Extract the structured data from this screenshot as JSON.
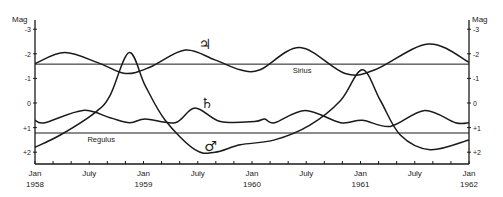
{
  "chart_data": {
    "type": "line",
    "title": "",
    "xlabel": "",
    "ylabel": "Mag",
    "ylabel_right": "Mag",
    "ylim": [
      2.4,
      -3.2
    ],
    "y_inverted": true,
    "y_ticks": [
      -3,
      -2,
      -1,
      0,
      1,
      2
    ],
    "y_tick_labels": [
      "-3",
      "-2",
      "-1",
      "0",
      "+1",
      "+2"
    ],
    "x_range_months": [
      0,
      48
    ],
    "x_tick_labels": [
      {
        "month": 0,
        "line1": "Jan",
        "line2": "1958"
      },
      {
        "month": 6,
        "line1": "July",
        "line2": ""
      },
      {
        "month": 12,
        "line1": "Jan",
        "line2": "1959"
      },
      {
        "month": 18,
        "line1": "July",
        "line2": ""
      },
      {
        "month": 24,
        "line1": "Jan",
        "line2": "1960"
      },
      {
        "month": 30,
        "line1": "July",
        "line2": ""
      },
      {
        "month": 36,
        "line1": "Jan",
        "line2": "1961"
      },
      {
        "month": 42,
        "line1": "July",
        "line2": ""
      },
      {
        "month": 48,
        "line1": "Jan",
        "line2": "1962"
      }
    ],
    "minor_tick_every_months": 2,
    "grid": false,
    "reference_lines": [
      {
        "name": "Sirius",
        "mag": -1.58,
        "label_month": 28.5
      },
      {
        "name": "Regulus",
        "mag": 1.22,
        "label_month": 5.8
      }
    ],
    "series": [
      {
        "name": "Jupiter",
        "symbol": "♃",
        "symbol_pos": {
          "month": 18.8,
          "mag": -2.4
        },
        "points": [
          [
            0,
            -1.6
          ],
          [
            3.3,
            -2.05
          ],
          [
            7.2,
            -1.6
          ],
          [
            10,
            -1.2
          ],
          [
            12.7,
            -1.45
          ],
          [
            16.6,
            -2.15
          ],
          [
            19.9,
            -1.75
          ],
          [
            22.7,
            -1.35
          ],
          [
            24.9,
            -1.35
          ],
          [
            29.3,
            -2.25
          ],
          [
            34.3,
            -1.2
          ],
          [
            37.6,
            -1.35
          ],
          [
            43.5,
            -2.4
          ],
          [
            48,
            -1.65
          ]
        ]
      },
      {
        "name": "Saturn",
        "symbol": "♄",
        "symbol_pos": {
          "month": 19.0,
          "mag": 0.0
        },
        "points": [
          [
            0,
            0.7
          ],
          [
            1.1,
            0.8
          ],
          [
            5.3,
            0.3
          ],
          [
            8.3,
            0.6
          ],
          [
            10.5,
            0.8
          ],
          [
            12.2,
            0.65
          ],
          [
            15.5,
            0.8
          ],
          [
            17.7,
            0.2
          ],
          [
            20.5,
            0.75
          ],
          [
            24.3,
            0.75
          ],
          [
            25.4,
            0.65
          ],
          [
            26.5,
            0.8
          ],
          [
            29.9,
            0.3
          ],
          [
            33.8,
            0.8
          ],
          [
            36.2,
            0.7
          ],
          [
            39.3,
            0.95
          ],
          [
            43.1,
            0.3
          ],
          [
            46.5,
            0.8
          ],
          [
            48,
            0.8
          ]
        ]
      },
      {
        "name": "Mars",
        "symbol": "♂",
        "symbol_pos": {
          "month": 19.4,
          "mag": 1.75
        },
        "points": [
          [
            0,
            1.8
          ],
          [
            2.8,
            1.3
          ],
          [
            6.6,
            0.4
          ],
          [
            8.3,
            -0.3
          ],
          [
            10.4,
            -2.05
          ],
          [
            12.2,
            -0.7
          ],
          [
            14.4,
            0.7
          ],
          [
            17.7,
            1.9
          ],
          [
            19.9,
            2.0
          ],
          [
            22.7,
            1.7
          ],
          [
            26.5,
            1.5
          ],
          [
            30.4,
            0.9
          ],
          [
            33.8,
            -0.1
          ],
          [
            36.2,
            -1.35
          ],
          [
            38.2,
            -0.1
          ],
          [
            40.4,
            1.3
          ],
          [
            43.7,
            1.9
          ],
          [
            48,
            1.5
          ]
        ]
      }
    ]
  },
  "labels": {
    "mag_left": "Mag",
    "mag_right": "Mag"
  }
}
